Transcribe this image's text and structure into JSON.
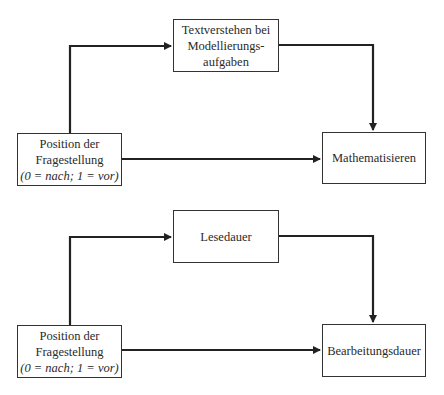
{
  "diagram": {
    "top": {
      "source": {
        "lines": [
          "Position der",
          "Fragestellung"
        ],
        "italic": "(0 = nach; 1 = vor)"
      },
      "mediator": {
        "lines": [
          "Textverstehen bei",
          "Modellierungs-",
          "aufgaben"
        ]
      },
      "outcome": {
        "lines": [
          "Mathematisieren"
        ]
      }
    },
    "bottom": {
      "source": {
        "lines": [
          "Position der",
          "Fragestellung"
        ],
        "italic": "(0 = nach; 1 = vor)"
      },
      "mediator": {
        "lines": [
          "Lesedauer"
        ]
      },
      "outcome": {
        "lines": [
          "Bearbeitungsdauer"
        ]
      }
    },
    "edges": [
      {
        "from": "top.source",
        "to": "top.mediator"
      },
      {
        "from": "top.mediator",
        "to": "top.outcome"
      },
      {
        "from": "top.source",
        "to": "top.outcome"
      },
      {
        "from": "bottom.source",
        "to": "bottom.mediator"
      },
      {
        "from": "bottom.mediator",
        "to": "bottom.outcome"
      },
      {
        "from": "bottom.source",
        "to": "bottom.outcome"
      }
    ],
    "colors": {
      "line": "#222222",
      "box_border": "#333333",
      "text": "#2a2a2a"
    }
  }
}
